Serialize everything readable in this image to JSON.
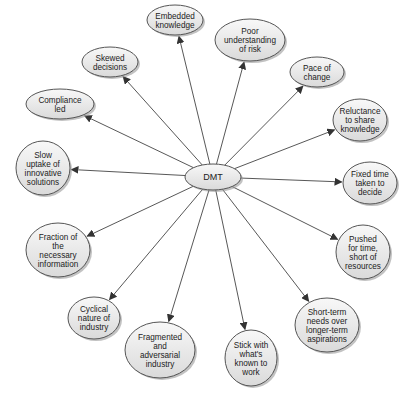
{
  "diagram": {
    "title": "DMT",
    "center": {
      "id": "dmt",
      "label": "DMT",
      "cx": 213,
      "cy": 177,
      "rx": 28,
      "ry": 13
    },
    "colors": {
      "node_fill_light": "#f7f7f7",
      "node_fill_dark": "#dcdcdc",
      "stroke": "#555555",
      "edge": "#444444",
      "text": "#222222"
    },
    "nodes": [
      {
        "id": "embedded-knowledge",
        "lines": [
          "Embedded",
          "knowledge"
        ],
        "cx": 175,
        "cy": 20,
        "rx": 28,
        "ry": 15
      },
      {
        "id": "poor-understanding-of-risk",
        "lines": [
          "Poor",
          "understanding",
          "of risk"
        ],
        "cx": 250,
        "cy": 40,
        "rx": 35,
        "ry": 21
      },
      {
        "id": "skewed-decisions",
        "lines": [
          "Skewed",
          "decisions"
        ],
        "cx": 110,
        "cy": 62,
        "rx": 28,
        "ry": 15
      },
      {
        "id": "pace-of-change",
        "lines": [
          "Pace of",
          "change"
        ],
        "cx": 317,
        "cy": 72,
        "rx": 27,
        "ry": 15
      },
      {
        "id": "compliance-led",
        "lines": [
          "Compliance",
          "led"
        ],
        "cx": 60,
        "cy": 104,
        "rx": 34,
        "ry": 15
      },
      {
        "id": "reluctance-to-share-knowledge",
        "lines": [
          "Reluctance",
          "to share",
          "knowledge"
        ],
        "cx": 360,
        "cy": 120,
        "rx": 27,
        "ry": 21
      },
      {
        "id": "slow-uptake",
        "lines": [
          "Slow",
          "uptake of",
          "innovative",
          "solutions"
        ],
        "cx": 43,
        "cy": 168,
        "rx": 27,
        "ry": 27
      },
      {
        "id": "fixed-time-taken-to-decide",
        "lines": [
          "Fixed time",
          "taken to",
          "decide"
        ],
        "cx": 370,
        "cy": 183,
        "rx": 27,
        "ry": 21
      },
      {
        "id": "fraction-of-necessary-information",
        "lines": [
          "Fraction of",
          "the",
          "necessary",
          "information"
        ],
        "cx": 58,
        "cy": 250,
        "rx": 32,
        "ry": 27
      },
      {
        "id": "pushed-for-time",
        "lines": [
          "Pushed",
          "for time,",
          "short of",
          "resources"
        ],
        "cx": 363,
        "cy": 252,
        "rx": 27,
        "ry": 27
      },
      {
        "id": "cyclical-nature-of-industry",
        "lines": [
          "Cyclical",
          "nature of",
          "industry"
        ],
        "cx": 94,
        "cy": 318,
        "rx": 26,
        "ry": 21
      },
      {
        "id": "short-term-needs",
        "lines": [
          "Short-term",
          "needs over",
          "longer-term",
          "aspirations"
        ],
        "cx": 327,
        "cy": 325,
        "rx": 32,
        "ry": 27
      },
      {
        "id": "fragmented-adversarial-industry",
        "lines": [
          "Fragmented",
          "and",
          "adversarial",
          "industry"
        ],
        "cx": 160,
        "cy": 350,
        "rx": 35,
        "ry": 28
      },
      {
        "id": "stick-with-whats-known",
        "lines": [
          "Stick with",
          "what's",
          "known to",
          "work"
        ],
        "cx": 251,
        "cy": 358,
        "rx": 26,
        "ry": 28
      }
    ]
  }
}
